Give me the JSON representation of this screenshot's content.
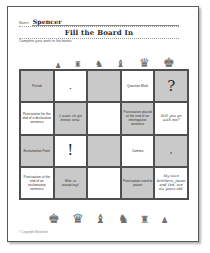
{
  "page": {
    "name_label": "Name:",
    "name_value": "Spencer",
    "title": "Fill the Board In",
    "instruction": "Complete your work in the boxes.",
    "footer": "© Copyright Worksheet"
  },
  "decor": {
    "pieces_top": [
      {
        "name": "chess-pawn-icon",
        "glyph": "♟",
        "size": 7
      },
      {
        "name": "chess-rook-icon",
        "glyph": "♜",
        "size": 8
      },
      {
        "name": "chess-knight-icon",
        "glyph": "♞",
        "size": 9
      },
      {
        "name": "chess-bishop-icon",
        "glyph": "♝",
        "size": 10
      },
      {
        "name": "chess-queen-icon",
        "glyph": "♛",
        "size": 12
      },
      {
        "name": "chess-king-icon",
        "glyph": "♚",
        "size": 13
      }
    ],
    "pieces_bottom": [
      {
        "name": "chess-king-icon",
        "glyph": "♚",
        "size": 13
      },
      {
        "name": "chess-queen-icon",
        "glyph": "♛",
        "size": 13
      },
      {
        "name": "chess-bishop-icon",
        "glyph": "♝",
        "size": 12
      },
      {
        "name": "chess-knight-icon",
        "glyph": "♞",
        "size": 12
      },
      {
        "name": "chess-rook-icon",
        "glyph": "♜",
        "size": 10
      },
      {
        "name": "chess-pawn-icon",
        "glyph": "♟",
        "size": 8
      }
    ]
  },
  "grid": {
    "columns": 5,
    "rows": 4,
    "cells": [
      {
        "text": "Period",
        "style": "plain",
        "shade": "shaded"
      },
      {
        "text": ".",
        "style": "glyph-sm",
        "shade": "light"
      },
      {
        "text": "",
        "style": "plain",
        "shade": "shaded"
      },
      {
        "text": "Question Mark",
        "style": "plain",
        "shade": "light"
      },
      {
        "text": "?",
        "style": "glyph",
        "shade": "shaded"
      },
      {
        "text": "Punctuation for the end of a declarative sentence",
        "style": "plain",
        "shade": "light"
      },
      {
        "text": "I want to go home now.",
        "style": "hand",
        "shade": "shaded"
      },
      {
        "text": "",
        "style": "plain",
        "shade": "light"
      },
      {
        "text": "Punctuation placed at the end of an interrogative sentence",
        "style": "plain",
        "shade": "shaded"
      },
      {
        "text": "Will you go with me?",
        "style": "hand",
        "shade": "light"
      },
      {
        "text": "Exclamation Point",
        "style": "plain",
        "shade": "shaded"
      },
      {
        "text": "!",
        "style": "glyph",
        "shade": "light"
      },
      {
        "text": "",
        "style": "plain",
        "shade": "shaded"
      },
      {
        "text": "Comma",
        "style": "plain",
        "shade": "light"
      },
      {
        "text": ",",
        "style": "glyph-sm",
        "shade": "shaded"
      },
      {
        "text": "Punctuation at the end of an exclamatory sentence",
        "style": "plain",
        "shade": "light"
      },
      {
        "text": "She is amazing!",
        "style": "hand",
        "shade": "shaded"
      },
      {
        "text": "",
        "style": "plain",
        "shade": "light"
      },
      {
        "text": "Punctuation used to pause",
        "style": "plain",
        "shade": "shaded"
      },
      {
        "text": "My twin brothers, Jason and Ted, are six years old.",
        "style": "hand",
        "shade": "light"
      }
    ]
  }
}
